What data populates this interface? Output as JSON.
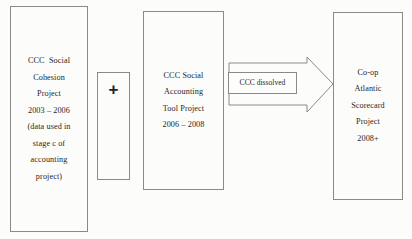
{
  "diagram": {
    "type": "process-flow",
    "background_color": "#fcfcfa",
    "border_color": "#8a8a8a",
    "text_color": "#1f1f1f",
    "nodes": {
      "cohesion_project": {
        "name": "CCC Social Cohesion Project",
        "lines": [
          "CCC  Social",
          "Cohesion",
          "Project",
          "",
          "2003 – 2006",
          "(data used in",
          "stage c of",
          "accounting",
          "project)"
        ]
      },
      "plus": {
        "name": "plus operator",
        "symbol": "+"
      },
      "accounting_project": {
        "name": "CCC Social Accounting Tool Project",
        "lines": [
          "CCC Social",
          "Accounting",
          "Tool Project",
          "",
          "2006 – 2008"
        ]
      },
      "scorecard_project": {
        "name": "Co-op Atlantic Scorecard Project",
        "lines": [
          "Co-op",
          "Atlantic",
          "Scorecard",
          "Project",
          "",
          "2008+"
        ]
      }
    },
    "arrow": {
      "name": "block-arrow-right",
      "direction": "right",
      "label": "CCC dissolved"
    }
  }
}
